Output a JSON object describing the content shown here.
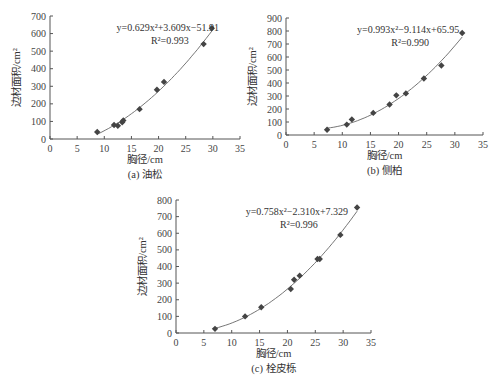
{
  "chart_data": [
    {
      "type": "scatter",
      "panel": "a",
      "caption": "(a) 油松",
      "xlabel": "胸径/cm",
      "ylabel": "边材面积/cm²",
      "xlim": [
        0,
        35
      ],
      "ylim": [
        0,
        700
      ],
      "xticks": [
        0,
        5,
        10,
        15,
        20,
        25,
        30,
        35
      ],
      "yticks": [
        0,
        100,
        200,
        300,
        400,
        500,
        600,
        700
      ],
      "equation": "y=0.629x²+3.609x−51.91",
      "r2": "R²=0.993",
      "fit": {
        "a": 0.629,
        "b": 3.609,
        "c": -51.91,
        "x_range": [
          8.7,
          29.8
        ]
      },
      "points": [
        [
          8.7,
          40
        ],
        [
          11.8,
          80
        ],
        [
          12.5,
          75
        ],
        [
          13.3,
          95
        ],
        [
          13.5,
          105
        ],
        [
          16.5,
          170
        ],
        [
          19.7,
          280
        ],
        [
          21.0,
          325
        ],
        [
          28.3,
          540
        ],
        [
          29.8,
          630
        ]
      ]
    },
    {
      "type": "scatter",
      "panel": "b",
      "caption": "(b) 侧柏",
      "xlabel": "胸径/cm",
      "ylabel": "边材面积/cm²",
      "xlim": [
        0,
        35
      ],
      "ylim": [
        0,
        900
      ],
      "xticks": [
        0,
        5,
        10,
        15,
        20,
        25,
        30,
        35
      ],
      "yticks": [
        0,
        100,
        200,
        300,
        400,
        500,
        600,
        700,
        800,
        900
      ],
      "equation": "y=0.993x²−9.114x+65.95",
      "r2": "R²=0.990",
      "fit": {
        "a": 0.993,
        "b": -9.114,
        "c": 65.95,
        "x_range": [
          7.3,
          31.3
        ]
      },
      "points": [
        [
          7.3,
          40
        ],
        [
          10.8,
          80
        ],
        [
          11.7,
          120
        ],
        [
          15.5,
          170
        ],
        [
          18.4,
          235
        ],
        [
          19.6,
          305
        ],
        [
          21.3,
          320
        ],
        [
          24.5,
          435
        ],
        [
          27.6,
          535
        ],
        [
          31.3,
          785
        ]
      ]
    },
    {
      "type": "scatter",
      "panel": "c",
      "caption": "(c) 栓皮栎",
      "xlabel": "胸径/cm",
      "ylabel": "边材面积/cm²",
      "xlim": [
        0,
        35
      ],
      "ylim": [
        0,
        800
      ],
      "xticks": [
        0,
        5,
        10,
        15,
        20,
        25,
        30,
        35
      ],
      "yticks": [
        0,
        100,
        200,
        300,
        400,
        500,
        600,
        700,
        800
      ],
      "equation": "y=0.758x²−2.310x+7.329",
      "r2": "R²=0.996",
      "fit": {
        "a": 0.758,
        "b": -2.31,
        "c": 7.329,
        "x_range": [
          7.0,
          32.5
        ]
      },
      "points": [
        [
          7.0,
          25
        ],
        [
          12.4,
          100
        ],
        [
          15.3,
          155
        ],
        [
          20.6,
          265
        ],
        [
          21.2,
          320
        ],
        [
          22.2,
          345
        ],
        [
          25.4,
          445
        ],
        [
          25.8,
          445
        ],
        [
          29.5,
          590
        ],
        [
          32.5,
          755
        ]
      ]
    }
  ],
  "layout": [
    {
      "x0": 50,
      "x1": 240,
      "y0": 139,
      "y1": 16,
      "cap_y": 178,
      "xlab_y": 163
    },
    {
      "x0": 286,
      "x1": 483,
      "y0": 135,
      "y1": 18,
      "cap_y": 174,
      "xlab_y": 159
    },
    {
      "x0": 176,
      "x1": 371,
      "y0": 333,
      "y1": 200,
      "cap_y": 372,
      "xlab_y": 357
    }
  ]
}
